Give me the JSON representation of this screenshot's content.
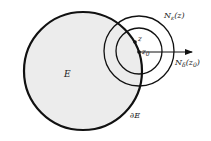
{
  "diagram": {
    "set_label": "E",
    "boundary_label": "∂E",
    "point_z_label": "z",
    "point_z0_label": "z",
    "point_z0_sub": "0",
    "nbhd_outer_label": "N",
    "nbhd_outer_sub": "ε",
    "nbhd_outer_arg": "(z)",
    "nbhd_inner_label": "N",
    "nbhd_inner_sub": "δ",
    "nbhd_inner_arg": "(z",
    "nbhd_inner_arg_sub": "0",
    "nbhd_inner_arg_close": ")",
    "colors": {
      "fill": "#ececec",
      "stroke": "#111111"
    }
  }
}
